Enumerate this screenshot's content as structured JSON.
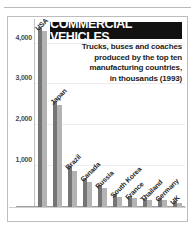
{
  "header": {
    "title": "COMMERCIAL VEHICLES",
    "subtitle_lines": [
      "Trucks, buses and coaches",
      "produced by the top ten",
      "manufacturing countries,",
      "in thousands (1993)"
    ]
  },
  "colors": {
    "banner_background": "#111111",
    "banner_text": "#ffffff",
    "bar_dark": "#757575",
    "bar_light": "#b3b3b3",
    "frame_border": "#bdbdbd",
    "gridline": "#ededed",
    "axis_text": "#4a4a4a"
  },
  "axis": {
    "y_ticks": [
      "1,000",
      "2,000",
      "3,000",
      "4,000"
    ]
  },
  "chart_data": {
    "type": "bar",
    "title": "COMMERCIAL VEHICLES",
    "subtitle": "Trucks, buses and coaches produced by the top ten manufacturing countries, in thousands (1993)",
    "xlabel": "",
    "ylabel": "thousands",
    "ylim": [
      0,
      4600
    ],
    "yticks": [
      1000,
      2000,
      3000,
      4000
    ],
    "ytick_labels": [
      "1,000",
      "2,000",
      "3,000",
      "4,000"
    ],
    "grid": true,
    "legend": "none",
    "categories": [
      "USA",
      "Japan",
      "Brazil",
      "Canada",
      "Russia",
      "South Korea",
      "France",
      "Thailand",
      "Germany",
      "UK"
    ],
    "series": [
      {
        "name": "dark",
        "values": [
          4400,
          2600,
          1000,
          700,
          540,
          330,
          270,
          210,
          220,
          150
        ]
      },
      {
        "name": "light",
        "values": [
          4300,
          2500,
          880,
          620,
          460,
          250,
          215,
          165,
          170,
          95
        ]
      }
    ]
  }
}
